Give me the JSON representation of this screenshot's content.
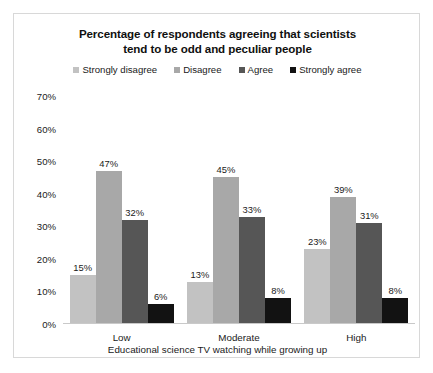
{
  "chart_data": {
    "type": "bar",
    "title": "Percentage of respondents agreeing that scientists tend to be odd and peculiar people",
    "title_line1": "Percentage of respondents agreeing that scientists",
    "title_line2": "tend to be odd and peculiar people",
    "xlabel": "Educational science TV watching while growing up",
    "ylabel": "",
    "ylim": [
      0,
      70
    ],
    "ytick_labels": [
      "70%",
      "60%",
      "50%",
      "40%",
      "30%",
      "20%",
      "10%",
      "0%"
    ],
    "ytick_values": [
      70,
      60,
      50,
      40,
      30,
      20,
      10,
      0
    ],
    "grid": false,
    "legend_position": "top",
    "categories": [
      "Low",
      "Moderate",
      "High"
    ],
    "series": [
      {
        "name": "Strongly disagree",
        "color": "#c2c2c2",
        "values": [
          15,
          13,
          23
        ],
        "labels": [
          "15%",
          "13%",
          "23%"
        ]
      },
      {
        "name": "Disagree",
        "color": "#a8a8a8",
        "values": [
          47,
          45,
          39
        ],
        "labels": [
          "47%",
          "45%",
          "39%"
        ]
      },
      {
        "name": "Agree",
        "color": "#565656",
        "values": [
          32,
          33,
          31
        ],
        "labels": [
          "32%",
          "33%",
          "31%"
        ]
      },
      {
        "name": "Strongly agree",
        "color": "#121212",
        "values": [
          6,
          8,
          8
        ],
        "labels": [
          "6%",
          "8%",
          "8%"
        ]
      }
    ]
  }
}
